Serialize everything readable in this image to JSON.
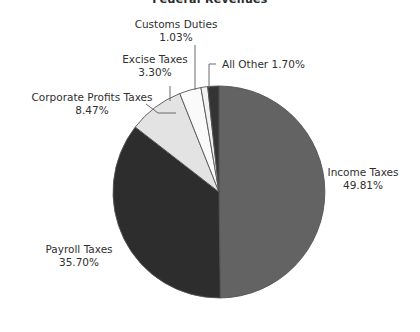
{
  "chart_data": {
    "type": "pie",
    "title": "Federal Revenues",
    "xlabel": "",
    "ylabel": "",
    "legend_position": "none",
    "grid": false,
    "labels_show_percent": true,
    "start_angle_deg": 0,
    "direction": "clockwise",
    "categories": [
      "Income Taxes",
      "Payroll Taxes",
      "Corporate Profits Taxes",
      "Excise Taxes",
      "Customs Duties",
      "All Other"
    ],
    "values": [
      49.81,
      35.7,
      8.47,
      3.3,
      1.03,
      1.7
    ],
    "units": "percent",
    "slices": [
      {
        "name": "Income Taxes",
        "value": 49.81,
        "percent_text": "49.81%",
        "label_line1": "Income Taxes",
        "label_line2": "49.81%",
        "color": "#636363",
        "leader": false
      },
      {
        "name": "Payroll Taxes",
        "value": 35.7,
        "percent_text": "35.70%",
        "label_line1": "Payroll Taxes",
        "label_line2": "35.70%",
        "color": "#2d2d2d",
        "leader": false
      },
      {
        "name": "Corporate Profits Taxes",
        "value": 8.47,
        "percent_text": "8.47%",
        "label_line1": "Corporate Profits Taxes",
        "label_line2": "8.47%",
        "color": "#e3e3e3",
        "leader": true
      },
      {
        "name": "Excise Taxes",
        "value": 3.3,
        "percent_text": "3.30%",
        "label_line1": "Excise Taxes",
        "label_line2": "3.30%",
        "color": "#fafafa",
        "leader": true
      },
      {
        "name": "Customs Duties",
        "value": 1.03,
        "percent_text": "1.03%",
        "label_line1": "Customs Duties",
        "label_line2": "1.03%",
        "color": "#f2f2f2",
        "leader": true
      },
      {
        "name": "All Other",
        "value": 1.7,
        "percent_text": "1.70%",
        "label_line1": "All Other 1.70%",
        "label_line2": "",
        "color": "#343434",
        "leader": true
      }
    ],
    "colors": {
      "background": "#ffffff",
      "outline": "#555555",
      "leader_line": "#6b6b6b",
      "text": "#2f2f2f"
    }
  }
}
